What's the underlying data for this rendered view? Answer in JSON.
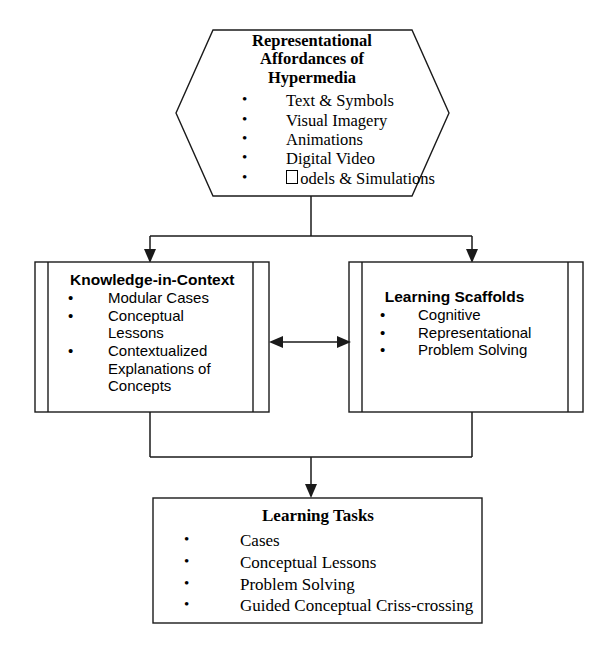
{
  "diagram": {
    "type": "flowchart",
    "orientation": "top-down",
    "ink_color": "#1a1a1a",
    "background_color": "#ffffff",
    "nodes": [
      {
        "id": "hexagon",
        "shape": "hexagon",
        "title": "Representational Affordances of Hypermedia",
        "title_lines": [
          "Representational",
          "Affordances of",
          "Hypermedia"
        ],
        "bullets": [
          "Text & Symbols",
          "Visual Imagery",
          "Animations",
          "Digital Video",
          "odels & Simulations"
        ],
        "bullet_note_last": "preceded by a missing-glyph box (intended: Models)"
      },
      {
        "id": "knowledge-in-context",
        "shape": "rectangle-double-sides",
        "title": "Knowledge-in-Context",
        "bullets": [
          "Modular Cases",
          "Conceptual",
          "Lessons",
          "Contextualized",
          "Explanations of",
          "Concepts"
        ],
        "bullet_dot_on": [
          true,
          true,
          false,
          true,
          false,
          false
        ]
      },
      {
        "id": "learning-scaffolds",
        "shape": "rectangle-double-sides",
        "title": "Learning Scaffolds",
        "bullets": [
          "Cognitive",
          "Representational",
          "Problem Solving"
        ],
        "bullet_dot_on": [
          true,
          true,
          true
        ]
      },
      {
        "id": "learning-tasks",
        "shape": "rectangle",
        "title": "Learning Tasks",
        "bullets": [
          "Cases",
          "Conceptual Lessons",
          "Problem Solving",
          "Guided Conceptual Criss-crossing"
        ],
        "bullet_dot_on": [
          true,
          true,
          true,
          true
        ]
      }
    ],
    "connectors": [
      {
        "id": "hex-to-left",
        "from": "hexagon",
        "to": "knowledge-in-context",
        "style": "elbow",
        "arrow": "end"
      },
      {
        "id": "hex-to-right",
        "from": "hexagon",
        "to": "learning-scaffolds",
        "style": "elbow",
        "arrow": "end"
      },
      {
        "id": "left-right-link",
        "from": "knowledge-in-context",
        "to": "learning-scaffolds",
        "style": "straight",
        "arrow": "both"
      },
      {
        "id": "merge-to-bottom",
        "from": "knowledge-in-context + learning-scaffolds",
        "to": "learning-tasks",
        "style": "merge-elbow",
        "arrow": "end"
      }
    ]
  }
}
